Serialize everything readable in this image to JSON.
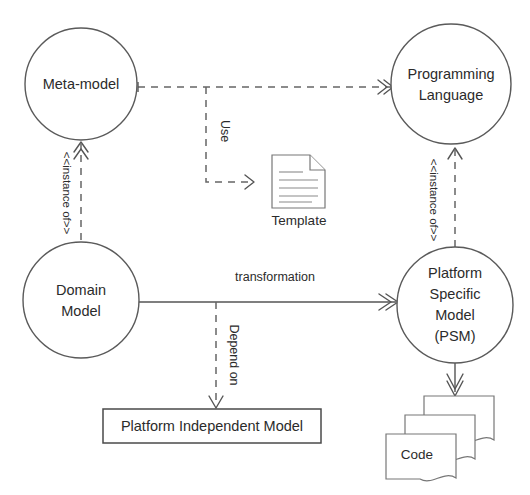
{
  "diagram": {
    "nodes": {
      "meta_model": {
        "label": "Meta-model",
        "shape": "circle"
      },
      "programming_language": {
        "line1": "Programming",
        "line2": "Language",
        "shape": "circle"
      },
      "domain_model": {
        "line1": "Domain",
        "line2": "Model",
        "shape": "circle"
      },
      "platform_specific_model": {
        "line1": "Platform",
        "line2": "Specific",
        "line3": "Model",
        "line4": "(PSM)",
        "shape": "circle"
      },
      "template": {
        "label": "Template",
        "shape": "document"
      },
      "platform_independent_model": {
        "label": "Platform Independent Model",
        "shape": "rectangle"
      },
      "code": {
        "label": "Code",
        "shape": "document-stack"
      }
    },
    "edges": {
      "use": {
        "label": "Use",
        "style": "dashed",
        "from": "meta-model",
        "to": "programming-language"
      },
      "use_template": {
        "label": "",
        "style": "dashed",
        "from": "use-branch",
        "to": "template"
      },
      "instance_of_left": {
        "label": "<<instance of>>",
        "style": "dashed",
        "from": "domain-model",
        "to": "meta-model"
      },
      "instance_of_right": {
        "label": "<<instance of>>",
        "style": "dashed",
        "from": "platform-specific-model",
        "to": "programming-language"
      },
      "transformation": {
        "label": "transformation",
        "style": "solid",
        "from": "domain-model",
        "to": "platform-specific-model"
      },
      "depend_on": {
        "label": "Depend on",
        "style": "dashed",
        "from": "transformation-branch",
        "to": "platform-independent-model"
      },
      "generates": {
        "label": "",
        "style": "solid",
        "from": "platform-specific-model",
        "to": "code"
      }
    },
    "colors": {
      "background": "#ffffff",
      "stroke": "#555555",
      "text": "#2b2b2b",
      "document_stroke": "#777777"
    }
  }
}
